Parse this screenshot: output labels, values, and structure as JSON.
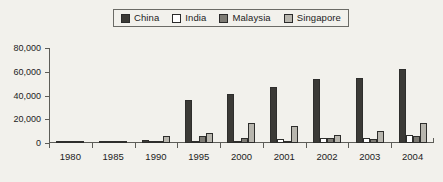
{
  "chart_data": {
    "type": "bar",
    "title": "",
    "subtitle": "",
    "xlabel": "",
    "ylabel": "",
    "categories": [
      "1980",
      "1985",
      "1990",
      "1995",
      "2000",
      "2001",
      "2002",
      "2003",
      "2004"
    ],
    "ylim": [
      0,
      80000
    ],
    "yticks": [
      0,
      20000,
      40000,
      60000,
      80000
    ],
    "ytick_labels": [
      "0",
      "20,000",
      "40,000",
      "60,000",
      "80,000"
    ],
    "grid": false,
    "legend_position": "top-center",
    "series": [
      {
        "name": "China",
        "color": "#3b3a36",
        "values": [
          200,
          900,
          2500,
          36500,
          41500,
          47500,
          54000,
          55000,
          62500
        ]
      },
      {
        "name": "India",
        "color": "#ffffff",
        "values": [
          100,
          200,
          400,
          1500,
          2000,
          3000,
          4000,
          4500,
          6500
        ]
      },
      {
        "name": "Malaysia",
        "color": "#7d7b74",
        "values": [
          700,
          500,
          2000,
          5500,
          4000,
          1000,
          4000,
          3500,
          6000
        ]
      },
      {
        "name": "Singapore",
        "color": "#b8b6ae",
        "values": [
          800,
          700,
          5500,
          8500,
          16500,
          14500,
          6500,
          10000,
          17000
        ]
      }
    ]
  },
  "legend": {
    "items": [
      {
        "label": "China",
        "swatch": "china-swatch"
      },
      {
        "label": "India",
        "swatch": "india-swatch"
      },
      {
        "label": "Malaysia",
        "swatch": "malaysia-swatch"
      },
      {
        "label": "Singapore",
        "swatch": "singapore-swatch"
      }
    ]
  },
  "colors": {
    "background": "#f2f1ec",
    "axis": "#5d5d58",
    "text": "#1c1c1c",
    "bar_outline": "#2e2e2c"
  }
}
